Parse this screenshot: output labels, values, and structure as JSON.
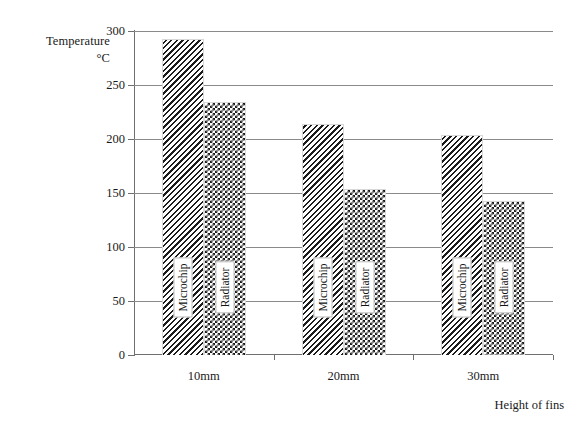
{
  "chart_data": {
    "type": "bar",
    "title": "",
    "subtitle": "",
    "ylabel_line1": "Temperature",
    "ylabel_line2": "°C",
    "xlabel": "Height of fins",
    "categories": [
      "10mm",
      "20mm",
      "30mm"
    ],
    "series": [
      {
        "name": "Microchip",
        "values": [
          293,
          214,
          204
        ],
        "pattern": "diagonal-hatch"
      },
      {
        "name": "Radiator",
        "values": [
          234,
          154,
          143
        ],
        "pattern": "checkerboard"
      }
    ],
    "ylim": [
      0,
      300
    ],
    "ytick_values": [
      0,
      50,
      100,
      150,
      200,
      250,
      300
    ],
    "ytick_labels": [
      "0",
      "50",
      "100",
      "150",
      "200",
      "250",
      "300"
    ],
    "grid": true,
    "grid_axis": "y",
    "legend": "in-bar-rotated-labels",
    "legend_position": "none",
    "bar_value_labels": false,
    "colors": {
      "background": "#ffffff",
      "axis": "#6f6f6f",
      "gridline": "#8a8a8a",
      "pattern_ink": "#1c1c1c",
      "text": "#1a1a1a"
    }
  }
}
